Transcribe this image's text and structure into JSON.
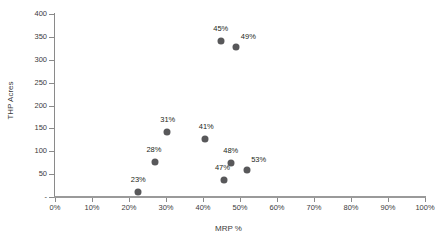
{
  "chart_data": {
    "type": "scatter",
    "title": "",
    "xlabel": "MRP %",
    "ylabel": "THP Acres",
    "xlim": [
      0,
      100
    ],
    "ylim": [
      0,
      400
    ],
    "grid": false,
    "legend": "none",
    "marker_color": "#58585a",
    "axis_color": "#8a8a8a",
    "x_ticklabels": [
      "0%",
      "10%",
      "20%",
      "30%",
      "40%",
      "50%",
      "60%",
      "70%",
      "80%",
      "90%",
      "100%"
    ],
    "x_tickvalues": [
      0,
      10,
      20,
      30,
      40,
      50,
      60,
      70,
      80,
      90,
      100
    ],
    "y_ticklabels": [
      "-",
      "50",
      "100",
      "150",
      "200",
      "250",
      "300",
      "350",
      "400"
    ],
    "y_tickvalues": [
      0,
      50,
      100,
      150,
      200,
      250,
      300,
      350,
      400
    ],
    "points": [
      {
        "label": "23%",
        "x": 22.5,
        "y": 10,
        "label_dx": 0,
        "label_dy": -13
      },
      {
        "label": "28%",
        "x": 27.0,
        "y": 76,
        "label_dx": -1,
        "label_dy": -13
      },
      {
        "label": "31%",
        "x": 30.2,
        "y": 143,
        "label_dx": 1,
        "label_dy": -13
      },
      {
        "label": "41%",
        "x": 40.6,
        "y": 127,
        "label_dx": 1,
        "label_dy": -13
      },
      {
        "label": "45%",
        "x": 44.8,
        "y": 341,
        "label_dx": 0,
        "label_dy": -13
      },
      {
        "label": "47%",
        "x": 45.8,
        "y": 38,
        "label_dx": -2,
        "label_dy": -13
      },
      {
        "label": "48%",
        "x": 47.5,
        "y": 74,
        "label_dx": 0,
        "label_dy": -13
      },
      {
        "label": "49%",
        "x": 49.0,
        "y": 327,
        "label_dx": 12,
        "label_dy": -11
      },
      {
        "label": "53%",
        "x": 51.8,
        "y": 60,
        "label_dx": 12,
        "label_dy": -11
      }
    ]
  }
}
